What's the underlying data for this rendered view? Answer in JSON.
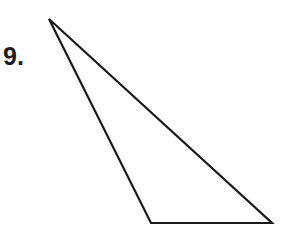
{
  "problem": {
    "number_label": "9."
  },
  "figure": {
    "shape": "triangle",
    "stroke_color": "#1a1a1a",
    "vertices": {
      "apex": [
        49,
        19
      ],
      "bottom_left": [
        151,
        223
      ],
      "bottom_right": [
        272,
        223
      ]
    }
  }
}
